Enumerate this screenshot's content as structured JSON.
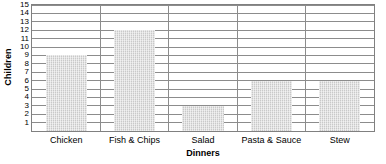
{
  "chart_data": {
    "type": "bar",
    "title": "",
    "subtitle": "",
    "xlabel": "Dinners",
    "ylabel": "Children",
    "categories": [
      "Chicken",
      "Fish & Chips",
      "Salad",
      "Pasta & Sauce",
      "Stew"
    ],
    "values": [
      9,
      12,
      3,
      6,
      6
    ],
    "series": [
      {
        "name": "Children",
        "values": [
          9,
          12,
          3,
          6,
          6
        ]
      }
    ],
    "ylim": [
      0,
      15
    ],
    "ytick_labels": [
      "1",
      "2",
      "3",
      "4",
      "5",
      "6",
      "7",
      "8",
      "9",
      "10",
      "11",
      "12",
      "13",
      "14",
      "15"
    ],
    "ytick_values": [
      1,
      2,
      3,
      4,
      5,
      6,
      7,
      8,
      9,
      10,
      11,
      12,
      13,
      14,
      15
    ],
    "ytick_step": 1,
    "grid": true,
    "grid_axis": "y",
    "legend": false,
    "legend_position": "none",
    "annotations": [],
    "colors": {
      "bar_fill": "#c9c9c9",
      "gridline": "#8c8c8c",
      "plot_border": "#808080",
      "text": "#000000",
      "background": "#ffffff"
    }
  },
  "axes": {
    "y_title": "Children",
    "x_title": "Dinners"
  }
}
